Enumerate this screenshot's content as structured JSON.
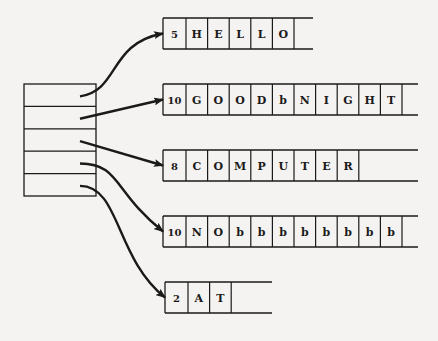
{
  "diagram": {
    "title": "",
    "pointer_array": {
      "slots": 5,
      "x": 24,
      "y": 84,
      "width": 72,
      "height": 112
    },
    "strings": [
      {
        "count": "5",
        "chars": [
          "H",
          "E",
          "L",
          "L",
          "O"
        ],
        "x": 163,
        "y": 18,
        "tail_end": 313
      },
      {
        "count": "10",
        "chars": [
          "G",
          "O",
          "O",
          "D",
          "b",
          "N",
          "I",
          "G",
          "H",
          "T"
        ],
        "x": 163,
        "y": 84,
        "tail_end": 418
      },
      {
        "count": "8",
        "chars": [
          "C",
          "O",
          "M",
          "P",
          "U",
          "T",
          "E",
          "R"
        ],
        "x": 163,
        "y": 150,
        "tail_end": 418
      },
      {
        "count": "10",
        "chars": [
          "N",
          "O",
          "b",
          "b",
          "b",
          "b",
          "b",
          "b",
          "b",
          "b"
        ],
        "x": 163,
        "y": 216,
        "tail_end": 418
      },
      {
        "count": "2",
        "chars": [
          "A",
          "T"
        ],
        "x": 165,
        "y": 282,
        "tail_end": 272
      }
    ],
    "arrows": [
      {
        "from_slot": 0,
        "to_string": 0
      },
      {
        "from_slot": 1,
        "to_string": 1
      },
      {
        "from_slot": 2,
        "to_string": 2
      },
      {
        "from_slot": 3,
        "to_string": 3
      },
      {
        "from_slot": 4,
        "to_string": 4
      }
    ],
    "blank_symbol": "b",
    "colors": {
      "ink": "#1a1a1a",
      "paper": "#f4f3f1"
    }
  }
}
